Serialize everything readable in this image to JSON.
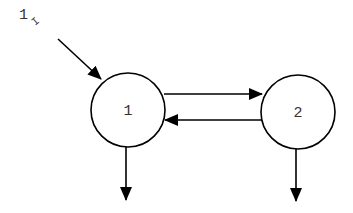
{
  "diagram": {
    "type": "two-compartment-model",
    "input": {
      "label": "1",
      "subscript": "I",
      "target": "1"
    },
    "nodes": [
      {
        "id": "1",
        "label": "1"
      },
      {
        "id": "2",
        "label": "2"
      }
    ],
    "edges": [
      {
        "from": "input",
        "to": "1"
      },
      {
        "from": "1",
        "to": "2"
      },
      {
        "from": "2",
        "to": "1"
      },
      {
        "from": "1",
        "to": "out"
      },
      {
        "from": "2",
        "to": "out"
      }
    ],
    "colors": {
      "stroke": "#000000",
      "text": "#333333",
      "background": "#ffffff"
    }
  }
}
